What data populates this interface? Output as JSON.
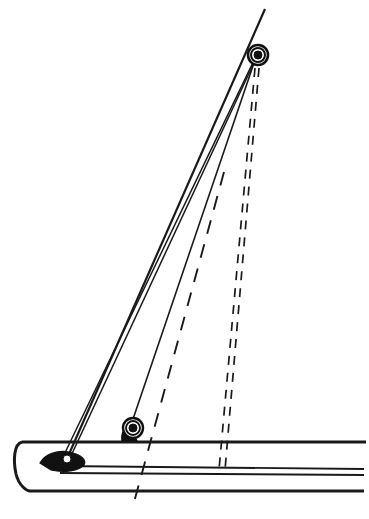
{
  "diagram": {
    "type": "technical-line-drawing",
    "canvas": {
      "width": 369,
      "height": 519,
      "background": "#ffffff"
    },
    "ink_color": "#1a1a1a",
    "fill_color": "#111111",
    "paper_color": "#ffffff"
  },
  "parts": {
    "mast": {
      "label": "mast",
      "top": {
        "x": 265,
        "y": 9
      },
      "bottom": {
        "x": 66,
        "y": 461
      },
      "stroke_width": 2.2
    },
    "forestay_outer": {
      "label": "forestay-outer",
      "top": {
        "x": 259,
        "y": 50
      },
      "bottom": {
        "x": 62,
        "y": 459
      },
      "stroke_width": 1.5
    },
    "forestay_inner": {
      "label": "forestay-inner",
      "top": {
        "x": 258,
        "y": 54
      },
      "bottom": {
        "x": 70,
        "y": 458
      },
      "stroke_width": 1.5
    },
    "shroud": {
      "label": "shroud-to-deck-block",
      "top": {
        "x": 256,
        "y": 57
      },
      "bottom": {
        "x": 131,
        "y": 425
      },
      "stroke_width": 1.6
    },
    "masthead_ring": {
      "label": "masthead-ring-fitting",
      "center": {
        "x": 258,
        "y": 55
      },
      "outer_radius": 10,
      "mid_radius": 7,
      "inner_radius": 4
    },
    "deck_block": {
      "label": "deck-mounted-block",
      "center": {
        "x": 133,
        "y": 428
      },
      "outer_radius": 10,
      "mid_radius": 7,
      "inner_radius": 4
    },
    "bow_fitting": {
      "label": "bow-stemhead-fitting",
      "hole_center": {
        "x": 67,
        "y": 461
      },
      "hole_radius": 4
    }
  },
  "hull": {
    "label": "hull-profile",
    "deck_line": {
      "y": 442,
      "x_start": 22,
      "x_end": 366
    },
    "rubrail_top": {
      "y": 466,
      "x_start": 60,
      "x_end": 364
    },
    "rubrail_bottom": {
      "y": 473,
      "x_start": 60,
      "x_end": 364
    },
    "bottom_line": {
      "y": 491,
      "x_start": 30,
      "x_end": 364
    },
    "bow_stem_x": 15
  },
  "reference_lines": {
    "centerline": {
      "label": "centerline-dashed",
      "style": "dashed",
      "dash_pattern": "14 11",
      "top": {
        "x": 224,
        "y": 172
      },
      "bottom": {
        "x": 133,
        "y": 506
      }
    },
    "alternate_mast_left": {
      "label": "alternate-mast-position-left-dashed",
      "style": "dashed",
      "dash_pattern": "9 8",
      "top": {
        "x": 255,
        "y": 68
      },
      "bottom": {
        "x": 219,
        "y": 470
      }
    },
    "alternate_mast_right": {
      "label": "alternate-mast-position-right-dashed",
      "style": "dashed",
      "dash_pattern": "9 8",
      "top": {
        "x": 259,
        "y": 68
      },
      "bottom": {
        "x": 225,
        "y": 470
      }
    }
  }
}
